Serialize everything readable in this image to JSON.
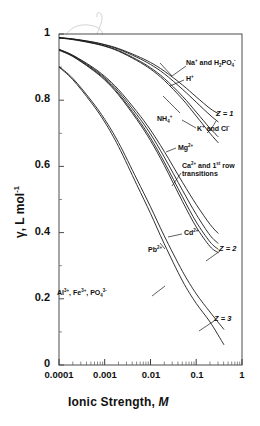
{
  "chart_data": {
    "type": "line",
    "title": "",
    "xlabel": "Ionic Strength, M",
    "ylabel": "γ, L mol⁻¹",
    "xscale": "log",
    "xlim": [
      0.0001,
      1
    ],
    "ylim": [
      0,
      1
    ],
    "xticks": [
      "0.0001",
      "0.001",
      "0.01",
      "0.1",
      "1"
    ],
    "xtick_values": [
      0.0001,
      0.001,
      0.01,
      0.1,
      1
    ],
    "yticks": [
      "0",
      "0.2",
      "0.4",
      "0.6",
      "0.8",
      "1"
    ],
    "ytick_values": [
      0,
      0.2,
      0.4,
      0.6,
      0.8,
      1
    ],
    "grid": false,
    "legend": "inline annotations",
    "line_color": "#1a1a1a",
    "series": [
      {
        "name": "Na+ and H2PO4-",
        "charge_group": "Z = 1",
        "x": [
          0.0001,
          0.0002,
          0.0005,
          0.001,
          0.002,
          0.005,
          0.01,
          0.02,
          0.05,
          0.1,
          0.2,
          0.3
        ],
        "values": [
          0.989,
          0.985,
          0.977,
          0.968,
          0.956,
          0.934,
          0.914,
          0.888,
          0.846,
          0.81,
          0.775,
          0.76
        ]
      },
      {
        "name": "H+",
        "charge_group": "Z = 1",
        "x": [
          0.0001,
          0.0002,
          0.0005,
          0.001,
          0.002,
          0.005,
          0.01,
          0.02,
          0.05,
          0.1,
          0.2,
          0.3
        ],
        "values": [
          0.989,
          0.985,
          0.976,
          0.967,
          0.954,
          0.93,
          0.908,
          0.88,
          0.833,
          0.794,
          0.755,
          0.735
        ]
      },
      {
        "name": "NH4+",
        "charge_group": "Z = 1",
        "x": [
          0.0001,
          0.0002,
          0.0005,
          0.001,
          0.002,
          0.005,
          0.01,
          0.02,
          0.05,
          0.1,
          0.2,
          0.3
        ],
        "values": [
          0.988,
          0.984,
          0.974,
          0.964,
          0.95,
          0.923,
          0.898,
          0.866,
          0.812,
          0.764,
          0.715,
          0.69
        ]
      },
      {
        "name": "K+ and Cl-",
        "charge_group": "Z = 1",
        "x": [
          0.0001,
          0.0002,
          0.0005,
          0.001,
          0.002,
          0.005,
          0.01,
          0.02,
          0.05,
          0.1,
          0.2,
          0.3
        ],
        "values": [
          0.988,
          0.983,
          0.973,
          0.963,
          0.948,
          0.92,
          0.894,
          0.86,
          0.803,
          0.752,
          0.7,
          0.672
        ]
      },
      {
        "name": "Mg2+",
        "charge_group": "Z = 2",
        "x": [
          0.0001,
          0.0002,
          0.0005,
          0.001,
          0.002,
          0.005,
          0.01,
          0.02,
          0.05,
          0.1,
          0.2,
          0.3
        ],
        "values": [
          0.954,
          0.936,
          0.903,
          0.872,
          0.832,
          0.766,
          0.71,
          0.645,
          0.552,
          0.485,
          0.425,
          0.398
        ]
      },
      {
        "name": "Ca2+ and 1st row transitions",
        "charge_group": "Z = 2",
        "x": [
          0.0001,
          0.0002,
          0.0005,
          0.001,
          0.002,
          0.005,
          0.01,
          0.02,
          0.05,
          0.1,
          0.2,
          0.3
        ],
        "values": [
          0.953,
          0.935,
          0.9,
          0.868,
          0.826,
          0.757,
          0.698,
          0.628,
          0.528,
          0.455,
          0.392,
          0.368
        ]
      },
      {
        "name": "Cd2+",
        "charge_group": "Z = 2",
        "x": [
          0.0001,
          0.0002,
          0.0005,
          0.001,
          0.002,
          0.005,
          0.01,
          0.02,
          0.05,
          0.1,
          0.2,
          0.3
        ],
        "values": [
          0.952,
          0.933,
          0.897,
          0.864,
          0.82,
          0.748,
          0.686,
          0.613,
          0.508,
          0.432,
          0.372,
          0.35
        ]
      },
      {
        "name": "Pb2+",
        "charge_group": "Z = 2",
        "x": [
          0.0001,
          0.0002,
          0.0005,
          0.001,
          0.002,
          0.005,
          0.01,
          0.02,
          0.05,
          0.1,
          0.2,
          0.3
        ],
        "values": [
          0.951,
          0.932,
          0.895,
          0.861,
          0.816,
          0.742,
          0.678,
          0.603,
          0.494,
          0.417,
          0.358,
          0.34
        ]
      },
      {
        "name": "Al3+, Fe3+, PO4 3-",
        "charge_group": "Z = 3",
        "x": [
          0.0001,
          0.0002,
          0.0005,
          0.001,
          0.002,
          0.005,
          0.01,
          0.02,
          0.05,
          0.1,
          0.2,
          0.4
        ],
        "values": [
          0.902,
          0.866,
          0.8,
          0.742,
          0.672,
          0.562,
          0.478,
          0.39,
          0.283,
          0.215,
          0.16,
          0.108
        ]
      },
      {
        "name": "Z = 3 lower",
        "charge_group": "Z = 3",
        "x": [
          0.0001,
          0.0002,
          0.0005,
          0.001,
          0.002,
          0.005,
          0.01,
          0.02,
          0.05,
          0.1,
          0.2,
          0.4
        ],
        "values": [
          0.9,
          0.862,
          0.794,
          0.734,
          0.66,
          0.545,
          0.458,
          0.366,
          0.254,
          0.186,
          0.13,
          0.062
        ]
      }
    ],
    "annotations": [
      {
        "id": "na-h2po4",
        "text": "Na⁺ and H₂PO₄⁻",
        "points_to": "Na+ and H2PO4-"
      },
      {
        "id": "h-plus",
        "text": "H⁺",
        "points_to": "H+"
      },
      {
        "id": "nh4",
        "text": "NH₄⁺",
        "points_to": "NH4+"
      },
      {
        "id": "k-cl",
        "text": "K⁺ and Cl⁻",
        "points_to": "K+ and Cl-"
      },
      {
        "id": "z1",
        "text": "Z = 1",
        "points_to": "Z = 1 family"
      },
      {
        "id": "mg",
        "text": "Mg²⁺",
        "points_to": "Mg2+"
      },
      {
        "id": "ca-row",
        "text": "Ca²⁺ and 1ˢᵗ row transitions",
        "points_to": "Ca2+ and 1st row transitions"
      },
      {
        "id": "cd",
        "text": "Cd²⁺",
        "points_to": "Cd2+"
      },
      {
        "id": "pb",
        "text": "Pb²⁺",
        "points_to": "Pb2+"
      },
      {
        "id": "z2",
        "text": "Z = 2",
        "points_to": "Z = 2 family"
      },
      {
        "id": "al-fe-po4",
        "text": "Al³⁺, Fe³⁺, PO₄³⁻",
        "points_to": "Al3+, Fe3+, PO4 3-"
      },
      {
        "id": "z3",
        "text": "Z = 3",
        "points_to": "Z = 3 family"
      }
    ]
  },
  "axes": {
    "x_title": "Ionic Strength, M",
    "x_title_main": "Ionic  Strength,",
    "x_title_italic": "M",
    "y_title_gamma": "γ",
    "y_title_rest": ", L mol",
    "y_title_exp": "-1",
    "xticks": [
      "0.0001",
      "0.001",
      "0.01",
      "0.1",
      "1"
    ],
    "yticks": [
      "1",
      "0.8",
      "0.6",
      "0.4",
      "0.2",
      "0"
    ]
  },
  "labels": {
    "na_h2po4_main": "Na",
    "na_h2po4_sup1": "+",
    "na_h2po4_mid": " and H",
    "na_h2po4_sub": "2",
    "na_h2po4_po": "PO",
    "na_h2po4_sub2": "4",
    "na_h2po4_sup2": "-",
    "h_main": "H",
    "h_sup": "+",
    "nh4_main": "NH",
    "nh4_sub": "4",
    "nh4_sup": "+",
    "kcl_main": "K",
    "kcl_sup1": "+",
    "kcl_mid": " and Cl",
    "kcl_sup2": "-",
    "z1": "Z = 1",
    "mg_main": "Mg",
    "mg_sup": "2+",
    "ca_main": "Ca",
    "ca_sup": "2+",
    "ca_mid": " and 1",
    "ca_sup2": "st",
    "ca_end": " row",
    "ca_line2": "transitions",
    "cd_main": "Cd",
    "cd_sup": "2+",
    "pb_main": "Pb",
    "pb_sup": "2+",
    "z2": "Z = 2",
    "al_main": "Al",
    "al_sup": "3+",
    "al_mid": ", Fe",
    "al_sup2": "3+",
    "al_po": ", PO",
    "al_sub": "4",
    "al_sup3": "3-",
    "z3": "Z = 3"
  }
}
